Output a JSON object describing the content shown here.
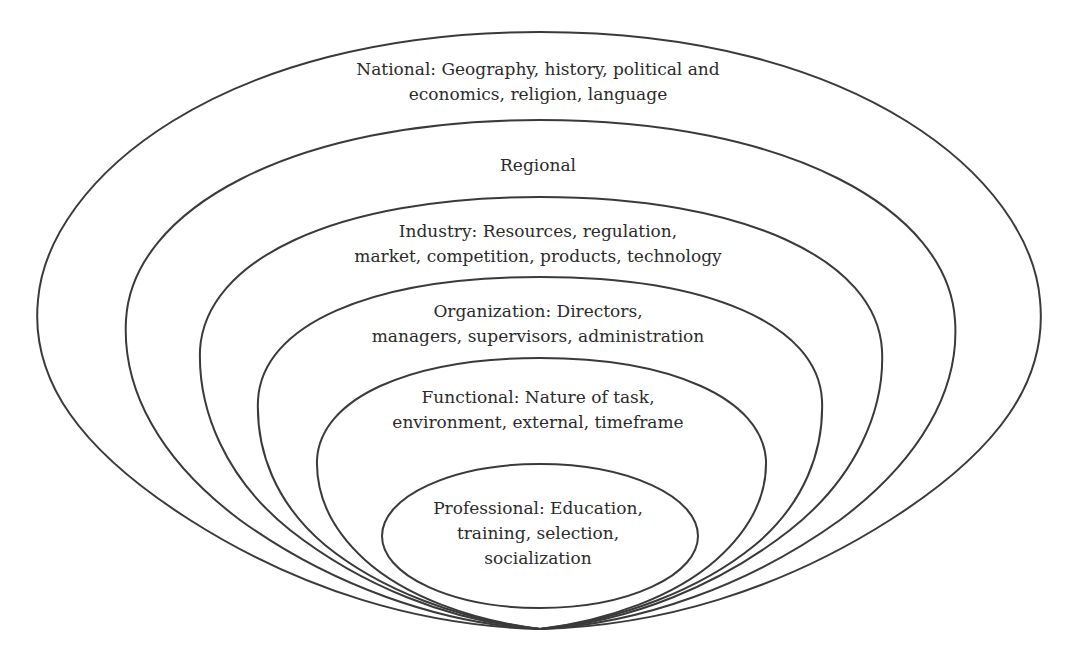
{
  "diagram": {
    "type": "nested-layers",
    "stroke_color": "#3a3a3a",
    "background": "#ffffff",
    "layers": [
      {
        "name": "National",
        "lines": [
          "National: Geography, history, political and",
          "economics, religion, language"
        ]
      },
      {
        "name": "Regional",
        "lines": [
          "Regional"
        ]
      },
      {
        "name": "Industry",
        "lines": [
          "Industry: Resources, regulation,",
          "market, competition, products, technology"
        ]
      },
      {
        "name": "Organization",
        "lines": [
          "Organization: Directors,",
          "managers, supervisors, administration"
        ]
      },
      {
        "name": "Functional",
        "lines": [
          "Functional: Nature of task,",
          "environment, external, timeframe"
        ]
      },
      {
        "name": "Professional",
        "lines": [
          "Professional: Education,",
          "training, selection,",
          "socialization"
        ]
      }
    ]
  }
}
